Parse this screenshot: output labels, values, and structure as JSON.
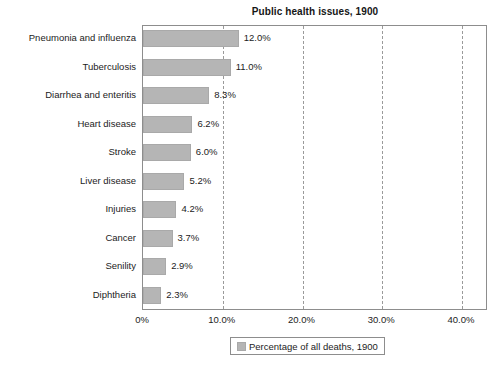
{
  "chart_data": {
    "type": "bar",
    "orientation": "horizontal",
    "title": "Public health issues, 1900",
    "xlabel": "",
    "ylabel": "",
    "xlim": [
      0,
      40
    ],
    "xticks": [
      "0%",
      "10.0%",
      "20.0%",
      "30.0%",
      "40.0%"
    ],
    "xtick_values": [
      0,
      10,
      20,
      30,
      40
    ],
    "grid": "vertical-dashed",
    "legend_position": "bottom-center",
    "categories": [
      "Pneumonia and influenza",
      "Tuberculosis",
      "Diarrhea and enteritis",
      "Heart disease",
      "Stroke",
      "Liver disease",
      "Injuries",
      "Cancer",
      "Senility",
      "Diphtheria"
    ],
    "values": [
      12.0,
      11.0,
      8.3,
      6.2,
      6.0,
      5.2,
      4.2,
      3.7,
      2.9,
      2.3
    ],
    "value_labels": [
      "12.0%",
      "11.0%",
      "8.3%",
      "6.2%",
      "6.0%",
      "5.2%",
      "4.2%",
      "3.7%",
      "2.9%",
      "2.3%"
    ],
    "series": [
      {
        "name": "Percentage of all deaths, 1900",
        "values": [
          12.0,
          11.0,
          8.3,
          6.2,
          6.0,
          5.2,
          4.2,
          3.7,
          2.9,
          2.3
        ]
      }
    ],
    "colors": {
      "bar": "#b5b5b5",
      "bar_border": "#a9a9a9",
      "plot_border": "#8d8d8d",
      "gridline": "#9a9a9a",
      "text": "#1c1c1c",
      "background": "#ffffff"
    }
  },
  "legend": {
    "entries": [
      {
        "label": "Percentage of all deaths, 1900",
        "color": "#b5b5b5"
      }
    ]
  }
}
